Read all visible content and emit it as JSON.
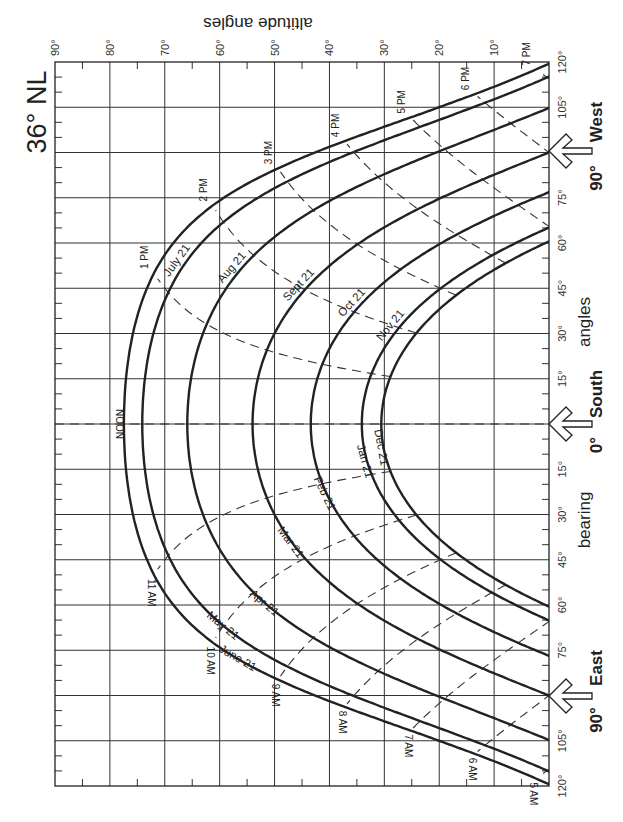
{
  "title": "36° NL",
  "chart_data": {
    "type": "line",
    "title": "36° NL",
    "subtitle": "Sun path diagram (rotated 90°)",
    "xlabel": "bearing angles",
    "ylabel": "altitude angles",
    "latitude_deg": 36,
    "altitude_axis": {
      "label": "altitude angles",
      "range": [
        0,
        90
      ],
      "ticks": [
        "90°",
        "80°",
        "70°",
        "60°",
        "50°",
        "40°",
        "30°",
        "20°",
        "10°"
      ]
    },
    "bearing_axis": {
      "label_left": "bearing",
      "label_right": "angles",
      "range": [
        -120,
        120
      ],
      "ticks": [
        "120°",
        "105°",
        "90°",
        "75°",
        "60°",
        "45°",
        "30°",
        "15°",
        "0°",
        "15°",
        "30°",
        "45°",
        "60°",
        "75°",
        "90°",
        "105°",
        "120°"
      ],
      "directions": [
        {
          "label": "90° West",
          "bearing": 90,
          "side": "west"
        },
        {
          "label": "0° South",
          "bearing": 0,
          "side": "south"
        },
        {
          "label": "90° East",
          "bearing": -90,
          "side": "east"
        }
      ]
    },
    "grid": true,
    "series": [
      {
        "name": "June 21",
        "declination": 23.45,
        "noon_altitude": 77.5
      },
      {
        "name": "May 21 / July 21",
        "declination": 20.1,
        "noon_altitude": 74.1
      },
      {
        "name": "Apr 21 / Aug 21",
        "declination": 11.9,
        "noon_altitude": 65.9
      },
      {
        "name": "Mar 21 / Sept 21",
        "declination": 0.0,
        "noon_altitude": 54.0
      },
      {
        "name": "Feb 21 / Oct 21",
        "declination": -10.6,
        "noon_altitude": 43.4
      },
      {
        "name": "Jan 21 / Nov 21",
        "declination": -19.9,
        "noon_altitude": 34.1
      },
      {
        "name": "Dec 21",
        "declination": -23.45,
        "noon_altitude": 30.55
      }
    ],
    "hour_lines": [
      "5 AM",
      "6 AM",
      "7 AM",
      "8 AM",
      "9 AM",
      "10 AM",
      "11 AM",
      "NOON",
      "1 PM",
      "2 PM",
      "3 PM",
      "4 PM",
      "5 PM",
      "6 PM",
      "7 PM"
    ]
  },
  "labels": {
    "altitude_axis_title": "altitude angles",
    "bearing_left": "bearing",
    "bearing_right": "angles",
    "west": "West",
    "south": "South",
    "east": "East",
    "west_deg": "90°",
    "south_deg": "0°",
    "east_deg": "90°",
    "noon": "NOON",
    "months_pm": [
      {
        "text": "July 21",
        "decl": 20.1,
        "hour": 1.35
      },
      {
        "text": "Aug 21",
        "decl": 11.9,
        "hour": 1.75
      },
      {
        "text": "Sept 21",
        "decl": 0.0,
        "hour": 2.05
      },
      {
        "text": "Oct 21",
        "decl": -10.6,
        "hour": 2.15
      },
      {
        "text": "Nov 21",
        "decl": -19.9,
        "hour": 2.0
      }
    ],
    "months_am": [
      {
        "text": "June 21",
        "decl": 23.45,
        "hour": -2.45
      },
      {
        "text": "May 21",
        "decl": 20.1,
        "hour": -2.05
      },
      {
        "text": "Apr 21",
        "decl": 11.9,
        "hour": -2.25
      },
      {
        "text": "Mar 21",
        "decl": 0.0,
        "hour": -1.75
      },
      {
        "text": "Feb 21",
        "decl": -10.6,
        "hour": -1.2
      },
      {
        "text": "Jan 21",
        "decl": -19.9,
        "hour": -0.75
      },
      {
        "text": "Dec 21",
        "decl": -23.45,
        "hour": -0.5
      }
    ]
  },
  "colors": {
    "ink": "#222222",
    "background": "#ffffff"
  }
}
